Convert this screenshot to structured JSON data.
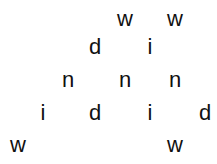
{
  "letters": [
    {
      "char": "w",
      "x": 125,
      "y": 19
    },
    {
      "char": "w",
      "x": 175,
      "y": 19
    },
    {
      "char": "d",
      "x": 95,
      "y": 47
    },
    {
      "char": "i",
      "x": 150,
      "y": 47
    },
    {
      "char": "n",
      "x": 68,
      "y": 80
    },
    {
      "char": "n",
      "x": 125,
      "y": 80
    },
    {
      "char": "n",
      "x": 175,
      "y": 80
    },
    {
      "char": "i",
      "x": 43,
      "y": 113
    },
    {
      "char": "d",
      "x": 95,
      "y": 113
    },
    {
      "char": "i",
      "x": 150,
      "y": 113
    },
    {
      "char": "d",
      "x": 205,
      "y": 113
    },
    {
      "char": "w",
      "x": 18,
      "y": 145
    },
    {
      "char": "w",
      "x": 175,
      "y": 145
    }
  ]
}
